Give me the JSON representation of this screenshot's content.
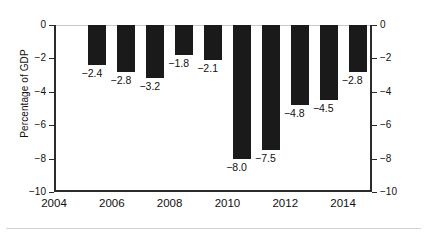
{
  "chart_data": {
    "type": "bar",
    "title": "",
    "xlabel": "",
    "ylabel": "Percentage of GDP",
    "categories": [
      "2005",
      "2006",
      "2007",
      "2008",
      "2009",
      "2010",
      "2011",
      "2012",
      "2013",
      "2014"
    ],
    "values": [
      -2.4,
      -2.8,
      -3.2,
      -1.8,
      -2.1,
      -8.0,
      -7.5,
      -4.8,
      -4.5,
      -2.8
    ],
    "data_labels": [
      "−2.4",
      "−2.8",
      "−3.2",
      "−1.8",
      "−2.1",
      "−8.0",
      "−7.5",
      "−4.8",
      "−4.5",
      "−2.8"
    ],
    "ylim": [
      -10,
      0
    ],
    "y_ticks": [
      0,
      -2,
      -4,
      -6,
      -8,
      -10
    ],
    "y_tick_labels_left": [
      "0",
      "−2",
      "−4",
      "−6",
      "−8",
      "−10"
    ],
    "y_tick_labels_right": [
      "0",
      "−2",
      "−4",
      "−6",
      "−8",
      "−10"
    ],
    "xlim": [
      2004,
      2015
    ],
    "x_ticks": [
      2004,
      2006,
      2008,
      2010,
      2012,
      2014
    ],
    "x_tick_labels": [
      "2004",
      "2006",
      "2008",
      "2010",
      "2012",
      "2014"
    ],
    "grid": false,
    "legend": null,
    "bar_color": "#1a1a1a",
    "axis_color": "#2b2b2b",
    "zero_line_color": "#c9c9c9",
    "background": "#ffffff"
  }
}
